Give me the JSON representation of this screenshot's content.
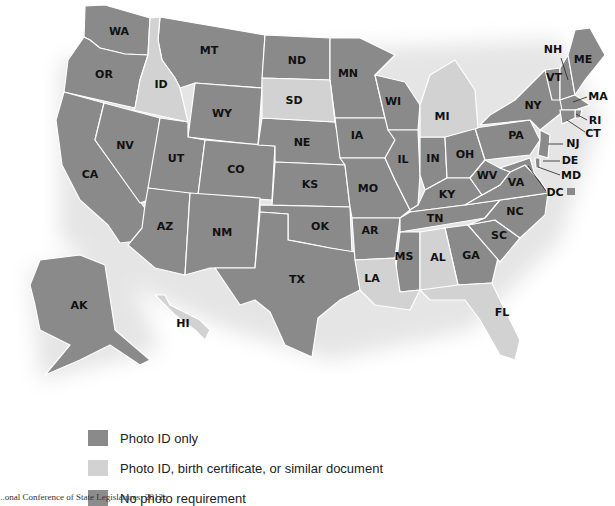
{
  "map": {
    "title": "",
    "colors": {
      "photo_id_only": "#8a8a8a",
      "photo_id_or_similar": "#d2d2d2",
      "no_photo": "#8c8c8c",
      "border": "#ffffff"
    },
    "states": {
      "WA": "WA",
      "OR": "OR",
      "CA": "CA",
      "ID": "ID",
      "NV": "NV",
      "MT": "MT",
      "WY": "WY",
      "UT": "UT",
      "AZ": "AZ",
      "CO": "CO",
      "NM": "NM",
      "ND": "ND",
      "SD": "SD",
      "NE": "NE",
      "KS": "KS",
      "OK": "OK",
      "TX": "TX",
      "MN": "MN",
      "IA": "IA",
      "MO": "MO",
      "AR": "AR",
      "LA": "LA",
      "WI": "WI",
      "IL": "IL",
      "MI": "MI",
      "IN": "IN",
      "OH": "OH",
      "KY": "KY",
      "TN": "TN",
      "MS": "MS",
      "AL": "AL",
      "GA": "GA",
      "FL": "FL",
      "SC": "SC",
      "NC": "NC",
      "VA": "VA",
      "WV": "WV",
      "PA": "PA",
      "NY": "NY",
      "VT": "VT",
      "NH": "NH",
      "ME": "ME",
      "MA": "MA",
      "RI": "RI",
      "CT": "CT",
      "NJ": "NJ",
      "DE": "DE",
      "MD": "MD",
      "DC": "DC",
      "AK": "AK",
      "HI": "HI"
    },
    "photo_id_or_similar_states": [
      "ID",
      "SD",
      "MI",
      "LA",
      "AL",
      "FL",
      "HI"
    ]
  },
  "legend": {
    "items": [
      {
        "label": "Photo ID only",
        "color": "#8a8a8a"
      },
      {
        "label": "Photo ID, birth certificate, or similar document",
        "color": "#d2d2d2"
      },
      {
        "label": "No photo requirement",
        "color": "#8c8c8c"
      }
    ]
  },
  "source": "...onal Conference of State Legislatures; 2012c"
}
